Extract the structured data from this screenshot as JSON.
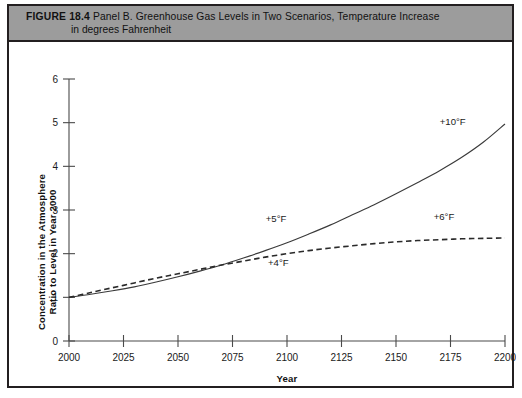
{
  "figure": {
    "label": "FIGURE 18.4",
    "caption_line1": "Panel B. Greenhouse Gas Levels in Two Scenarios, Temperature Increase",
    "caption_line2": "in degrees Fahrenheit",
    "band_color": "#9c9c9c",
    "border_color": "#231f20"
  },
  "chart_data": {
    "type": "line",
    "title": "Panel B. Greenhouse Gas Levels in Two Scenarios, Temperature Increase in degrees Fahrenheit",
    "xlabel": "Year",
    "ylabel": "Concentration in the Atmosphere Ratio to Level in Year 2000",
    "ylabel_line1": "Concentration in the Atmosphere",
    "ylabel_line2": "Ratio to Level in Year 2000",
    "xlim": [
      2000,
      2200
    ],
    "ylim": [
      0,
      6
    ],
    "xticks": [
      2000,
      2025,
      2050,
      2075,
      2100,
      2125,
      2150,
      2175,
      2200
    ],
    "yticks": [
      0,
      1,
      2,
      3,
      4,
      5,
      6
    ],
    "grid": false,
    "legend": "none",
    "x": [
      2000,
      2010,
      2020,
      2030,
      2040,
      2050,
      2060,
      2070,
      2080,
      2090,
      2100,
      2110,
      2120,
      2130,
      2140,
      2150,
      2160,
      2170,
      2180,
      2190,
      2200
    ],
    "series": [
      {
        "name": "High scenario",
        "style": "solid",
        "color": "#3a3a3a",
        "values": [
          1.0,
          1.07,
          1.15,
          1.24,
          1.35,
          1.47,
          1.6,
          1.74,
          1.9,
          2.07,
          2.25,
          2.45,
          2.66,
          2.89,
          3.12,
          3.37,
          3.63,
          3.9,
          4.2,
          4.55,
          4.97
        ],
        "end_value": 4.97,
        "annotations": [
          {
            "text": "+5°F",
            "x": 2095,
            "y": 2.72
          },
          {
            "text": "+10°F",
            "x": 2176,
            "y": 4.95
          }
        ]
      },
      {
        "name": "Low scenario",
        "style": "dashed",
        "color": "#2a2a2a",
        "values": [
          1.0,
          1.11,
          1.22,
          1.33,
          1.44,
          1.54,
          1.64,
          1.74,
          1.83,
          1.92,
          2.0,
          2.07,
          2.13,
          2.18,
          2.23,
          2.27,
          2.3,
          2.32,
          2.34,
          2.35,
          2.36
        ],
        "end_value": 2.36,
        "annotations": [
          {
            "text": "+4°F",
            "x": 2096,
            "y": 1.71
          },
          {
            "text": "+6°F",
            "x": 2172,
            "y": 2.78
          }
        ]
      }
    ],
    "crossover": {
      "year": 2070,
      "value": 1.74
    }
  }
}
